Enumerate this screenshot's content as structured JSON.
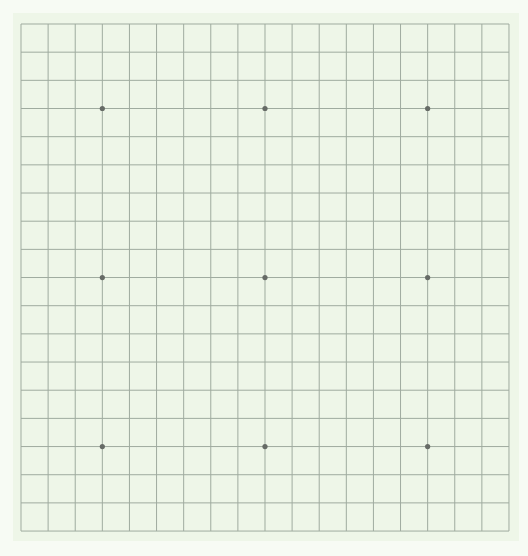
{
  "game": "go",
  "board": {
    "size": 19,
    "origin_px": {
      "x": 21,
      "y": 24
    },
    "spacing_px": {
      "x": 27.11,
      "y": 28.17
    },
    "board_rect": {
      "x": 13,
      "y": 13,
      "w": 506,
      "h": 528
    },
    "colors": {
      "page_bg": "#f7fbf4",
      "board_bg": "#eef6e8",
      "line": "#9fab9f",
      "star": "#666b66"
    },
    "star_points": [
      [
        3,
        3
      ],
      [
        9,
        3
      ],
      [
        15,
        3
      ],
      [
        3,
        9
      ],
      [
        9,
        9
      ],
      [
        15,
        9
      ],
      [
        3,
        15
      ],
      [
        9,
        15
      ],
      [
        15,
        15
      ]
    ],
    "stones": []
  }
}
